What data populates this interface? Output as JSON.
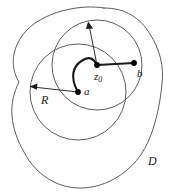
{
  "figure": {
    "type": "mathematical-diagram",
    "background_color": "#ffffff",
    "stroke_color": "#4a4a4a",
    "path_color": "#1a1a1a",
    "point_color": "#000000",
    "labels": {
      "a": "a",
      "b": "b",
      "R": "R",
      "D": "D",
      "z0_base": "z",
      "z0_sub": "0"
    },
    "points": [
      {
        "name": "a",
        "x": 78,
        "y": 92
      },
      {
        "name": "z0",
        "x": 97,
        "y": 65
      },
      {
        "name": "b",
        "x": 134,
        "y": 63
      }
    ],
    "circles": [
      {
        "name": "circle-a",
        "cx": 78,
        "cy": 92,
        "r": 48,
        "label": "R"
      },
      {
        "name": "circle-z0",
        "cx": 97,
        "cy": 65,
        "r": 45,
        "label": ""
      }
    ],
    "arrows": [
      {
        "name": "radius-arrow-a",
        "from_x": 78,
        "from_y": 92,
        "to_x": 30,
        "to_y": 87,
        "label": "R"
      },
      {
        "name": "radius-arrow-z0",
        "from_x": 97,
        "from_y": 65,
        "to_x": 88,
        "to_y": 22,
        "label": ""
      }
    ],
    "segments": [
      {
        "name": "segment-z0-b",
        "from": "z0",
        "to": "b"
      }
    ],
    "arcs": [
      {
        "name": "arc-a-z0",
        "from": "a",
        "to": "z0"
      }
    ]
  }
}
